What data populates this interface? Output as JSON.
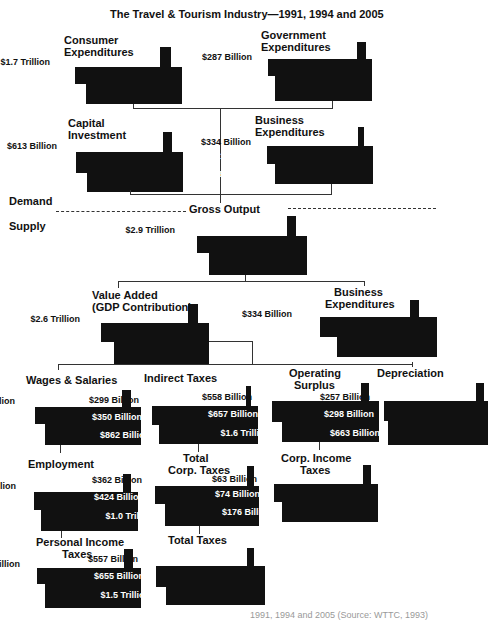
{
  "title": "The Travel & Tourism Industry—1991, 1994 and 2005",
  "side_labels": {
    "demand": "Demand",
    "supply": "Supply",
    "gross_output": "Gross Output"
  },
  "caption": "1991, 1994 and 2005 (Source: WTTC, 1993)",
  "years": [
    "1991",
    "1994",
    "2005"
  ],
  "colors": {
    "block": "#111111",
    "text_on_block": "#ffffff",
    "line": "#333333"
  },
  "blocks": {
    "consumer": {
      "label": [
        "Consumer",
        "Expenditures"
      ],
      "values": [
        "$1.7 Trillion",
        "$2.0 Trillion",
        "$4.6 Trillion"
      ]
    },
    "government": {
      "label": [
        "Government",
        "Expenditures"
      ],
      "values": [
        "$287 Billion",
        "$352 Billion",
        "$826 Billion"
      ]
    },
    "capital": {
      "label": [
        "Capital",
        "Investment"
      ],
      "values": [
        "$613 Billion",
        "$693 Billion",
        "$1.7 Trillion"
      ]
    },
    "business_demand": {
      "label": [
        "Business",
        "Expenditures"
      ],
      "values": [
        "$334 Billion",
        "$401 Billion",
        "$818 Billion"
      ]
    },
    "gross_output": {
      "label": [
        "Gross Output"
      ],
      "values": [
        "$2.9 Trillion",
        "$3.4 Trillion",
        "$7.9 Trillion"
      ]
    },
    "value_added": {
      "label": [
        "Value Added",
        "(GDP Contribution)"
      ],
      "values": [
        "$2.6 Trillion",
        "$3.0 Trillion",
        "$7.1 Trillion"
      ]
    },
    "business_supply": {
      "label": [
        "Business",
        "Expenditures"
      ],
      "values": [
        "$334 Billion",
        "$401 Billion",
        "$818 Billion"
      ]
    },
    "wages": {
      "label": [
        "Wages & Salaries"
      ],
      "values": [
        "$1.5 Trillion",
        "$1.7 Trillion",
        "$4.0 Trillion"
      ]
    },
    "indirect_taxes": {
      "label": [
        "Indirect Taxes"
      ],
      "values": [
        "$299 Billion",
        "$350 Billion",
        "$862 Billion"
      ]
    },
    "operating_surplus": {
      "label": [
        "Operating",
        "Surplus"
      ],
      "values": [
        "$558 Billion",
        "$657 Billion",
        "$1.6 Trillion"
      ]
    },
    "depreciation": {
      "label": [
        "Depreciation"
      ],
      "values": [
        "$257 Billion",
        "$298 Billion",
        "$663 Billion"
      ]
    },
    "employment": {
      "label": [
        "Employment"
      ],
      "values": [
        "183 Million",
        "$204 Million",
        "$348 Million"
      ]
    },
    "total_corp_taxes": {
      "label": [
        "Total",
        "Corp. Taxes"
      ],
      "values": [
        "$362 Billion",
        "$424 Billion",
        "$1.0 Trillion"
      ]
    },
    "corp_income_taxes": {
      "label": [
        "Corp. Income",
        "Taxes"
      ],
      "values": [
        "$63 Billion",
        "$74 Billion",
        "$176 Billion"
      ]
    },
    "personal_income_taxes": {
      "label": [
        "Personal Income",
        "Taxes"
      ],
      "values": [
        "$195 Billion",
        "$231 Billion",
        "$540 Billion"
      ]
    },
    "total_taxes": {
      "label": [
        "Total Taxes"
      ],
      "values": [
        "$557 Billion",
        "$655 Billion",
        "$1.5 Trillion"
      ]
    }
  }
}
